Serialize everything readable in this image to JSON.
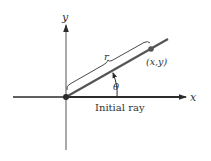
{
  "diagram": {
    "type": "polar-coordinates",
    "labels": {
      "x_axis": "x",
      "y_axis": "y",
      "radius": "r",
      "angle": "θ",
      "point": "(x,y)",
      "initial_ray": "Initial ray"
    },
    "colors": {
      "axis": "#2b2b2b",
      "ray": "#555555",
      "point": "#555555",
      "text": "#333333"
    }
  }
}
